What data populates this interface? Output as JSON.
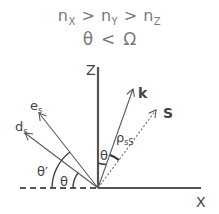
{
  "header": {
    "n_symbol": "n",
    "sub_x": "X",
    "sub_y": "Y",
    "sub_z": "Z",
    "gt": ">",
    "theta": "θ",
    "lt": "<",
    "omega": "Ω"
  },
  "axes": {
    "z_label": "Z",
    "x_label": "X"
  },
  "vectors": {
    "k_label": "k",
    "s_label": "S",
    "es_main": "e",
    "es_sub": "s",
    "ds_main": "d",
    "ds_sub": "s"
  },
  "angles": {
    "theta_z_k": "θ",
    "rho_main": "ρ",
    "rho_sub": "sS",
    "theta_ds": "θ",
    "theta_prime": "θ′"
  },
  "colors": {
    "header_text": "#7a7a7a",
    "lines": "#5a5a5a",
    "axis": "#555555",
    "labels": "#444444"
  }
}
